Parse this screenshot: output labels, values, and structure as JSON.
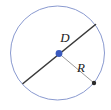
{
  "figure": {
    "kind": "circle-diameter-radius-diagram",
    "background_color": "#ffffff",
    "width": 111,
    "height": 110
  },
  "circle": {
    "name": "circle-outline",
    "center_x": 57.5,
    "center_y": 53,
    "radius": 47,
    "stroke_color": "#8a9ad0",
    "stroke_width": 1,
    "fill": "none"
  },
  "center_point": {
    "name": "circle-center-point",
    "x": 59,
    "y": 53.5,
    "color": "#3b5bbf",
    "size": 3.4
  },
  "diameter": {
    "label": "D",
    "stroke_color": "#3a3a3a",
    "stroke_width": 1.6,
    "x1": 23,
    "y1": 83.5,
    "x2": 95.5,
    "y2": 24.5,
    "label_x": 65,
    "label_y": 42
  },
  "radius": {
    "label": "R",
    "stroke_color": "#9a9a9a",
    "stroke_width": 1,
    "x1": 59,
    "y1": 53.5,
    "x2": 94,
    "y2": 83,
    "label_x": 81,
    "label_y": 72
  },
  "radius_endpoint": {
    "name": "radius-endpoint-dot",
    "x": 94,
    "y": 83,
    "color": "#2b2b2b",
    "size": 2.2
  }
}
